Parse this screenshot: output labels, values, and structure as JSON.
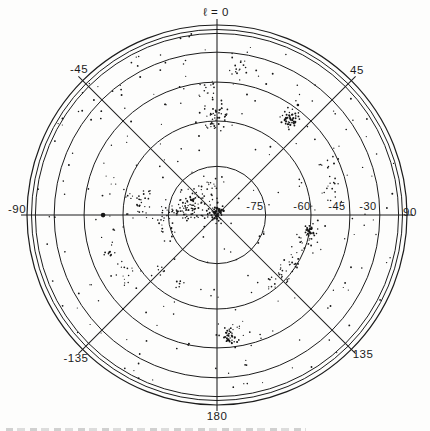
{
  "figure": {
    "background_color": "#fdfdfc",
    "ink_color": "#1c1c1c",
    "dot_color": "#161616",
    "top_label": "ℓ = 0",
    "bottom_label": "180",
    "caption_fragment_present": true
  },
  "chart_data": {
    "type": "scatter",
    "title": "ℓ = 0",
    "xlabel": "galactic longitude ℓ (deg, around rim)",
    "ylabel": "galactic latitude b (deg, radial rings)",
    "legend": [],
    "grid": "polar",
    "projection": {
      "kind": "south-polar-cap",
      "center_px": [
        217,
        215
      ],
      "ring_scale_px": 188,
      "frame_radii_px": [
        190,
        185.5
      ],
      "azimuth_zero": "top",
      "azimuth_direction": "clockwise",
      "latitude_range": [
        -90,
        0
      ]
    },
    "rings_b_deg": [
      -15,
      -30,
      -45,
      -60,
      -75
    ],
    "spokes_l_deg": [
      0,
      45,
      90,
      135,
      180,
      -45,
      -90,
      -135
    ],
    "spoke_overhang_px": 6,
    "angle_labels": [
      {
        "text": "ℓ = 0",
        "x": 216,
        "y": 16
      },
      {
        "text": "45",
        "x": 357,
        "y": 74
      },
      {
        "text": "-45",
        "x": 79,
        "y": 73
      },
      {
        "text": "90",
        "x": 410,
        "y": 216
      },
      {
        "text": "-90",
        "x": 17,
        "y": 213
      },
      {
        "text": "135",
        "x": 363,
        "y": 358
      },
      {
        "text": "-135",
        "x": 76,
        "y": 362
      },
      {
        "text": "180",
        "x": 217,
        "y": 420
      }
    ],
    "ring_labels": [
      {
        "text": "-75",
        "x": 255,
        "y": 210
      },
      {
        "text": "-60",
        "x": 302,
        "y": 210
      },
      {
        "text": "-45",
        "x": 337,
        "y": 210
      },
      {
        "text": "-30",
        "x": 368,
        "y": 210
      }
    ],
    "clusters": [
      {
        "name": "central-core",
        "l": 0,
        "b": -89.3,
        "sigma_deg": 1.0,
        "n": 55,
        "dot": 0.9
      },
      {
        "name": "core-halo",
        "l": -60,
        "b": -87.5,
        "sigma_deg": 2.3,
        "n": 22,
        "dot": 0.8
      },
      {
        "name": "west-complex-main",
        "l": -77,
        "b": -80.5,
        "sigma_deg": 2.2,
        "n": 60,
        "dot": 0.85
      },
      {
        "name": "west-complex-outer",
        "l": -93,
        "b": -74.5,
        "sigma_deg": 2.8,
        "n": 35,
        "dot": 0.8
      },
      {
        "name": "west-complex-upper",
        "l": -53,
        "b": -80.0,
        "sigma_deg": 1.8,
        "n": 25,
        "dot": 0.8
      },
      {
        "name": "above-center-knot",
        "l": -10,
        "b": -80.0,
        "sigma_deg": 1.5,
        "n": 12,
        "dot": 0.8
      },
      {
        "name": "west-ring-clump",
        "l": -79,
        "b": -65.0,
        "sigma_deg": 2.0,
        "n": 28,
        "dot": 0.8
      },
      {
        "name": "north-axis-clump",
        "l": 1,
        "b": -57.5,
        "sigma_deg": 1.8,
        "n": 30,
        "dot": 0.85
      },
      {
        "name": "north-axis-clump-lower",
        "l": -3,
        "b": -61.0,
        "sigma_deg": 1.2,
        "n": 12,
        "dot": 0.8
      },
      {
        "name": "north-small-clump",
        "l": -4.5,
        "b": -48.0,
        "sigma_deg": 1.4,
        "n": 15,
        "dot": 0.8
      },
      {
        "name": "north-loose-clump",
        "l": 7.7,
        "b": -37.5,
        "sigma_deg": 1.8,
        "n": 17,
        "dot": 0.8
      },
      {
        "name": "northeast-dense-cluster",
        "l": 37,
        "b": -50.0,
        "sigma_deg": 1.3,
        "n": 48,
        "dot": 0.9
      },
      {
        "name": "northeast-big-dot",
        "l": 36.4,
        "b": -43.4,
        "sigma_deg": 0.05,
        "n": 1,
        "dot": 1.7
      },
      {
        "name": "east-stream-a",
        "l": 66,
        "b": -49.0,
        "sigma_deg": 1.5,
        "n": 8,
        "dot": 0.75
      },
      {
        "name": "east-stream-b",
        "l": 74,
        "b": -50.5,
        "sigma_deg": 1.5,
        "n": 9,
        "dot": 0.75
      },
      {
        "name": "east-stream-c",
        "l": 81,
        "b": -51.5,
        "sigma_deg": 1.5,
        "n": 8,
        "dot": 0.75
      },
      {
        "name": "southeast-dense-clump",
        "l": 98.5,
        "b": -59.5,
        "sigma_deg": 1.2,
        "n": 28,
        "dot": 0.9
      },
      {
        "name": "southeast-stream-a",
        "l": 108,
        "b": -61.0,
        "sigma_deg": 1.5,
        "n": 14,
        "dot": 0.8
      },
      {
        "name": "southeast-stream-b",
        "l": 120,
        "b": -61.5,
        "sigma_deg": 1.6,
        "n": 16,
        "dot": 0.8
      },
      {
        "name": "southeast-stream-c",
        "l": 131,
        "b": -62.5,
        "sigma_deg": 1.5,
        "n": 14,
        "dot": 0.8
      },
      {
        "name": "southeast-stream-d",
        "l": 140,
        "b": -62.0,
        "sigma_deg": 1.4,
        "n": 12,
        "dot": 0.8
      },
      {
        "name": "south-axis-cluster",
        "l": 174,
        "b": -49.0,
        "sigma_deg": 1.3,
        "n": 32,
        "dot": 0.9
      },
      {
        "name": "south-axis-halo",
        "l": 172,
        "b": -52.5,
        "sigma_deg": 2.2,
        "n": 12,
        "dot": 0.75
      },
      {
        "name": "southwest-knot-1",
        "l": -108.7,
        "b": -52.3,
        "sigma_deg": 0.7,
        "n": 7,
        "dot": 0.9
      },
      {
        "name": "southwest-loose-group",
        "l": -123,
        "b": -54.5,
        "sigma_deg": 2.3,
        "n": 14,
        "dot": 0.75
      },
      {
        "name": "southwest-knot-2",
        "l": -134.5,
        "b": -65.0,
        "sigma_deg": 0.9,
        "n": 6,
        "dot": 0.85
      },
      {
        "name": "southwest-knot-3",
        "l": -152,
        "b": -65.5,
        "sigma_deg": 0.8,
        "n": 6,
        "dot": 0.85
      },
      {
        "name": "west-axis-big-dot",
        "l": -90,
        "b": -52.7,
        "sigma_deg": 0.05,
        "n": 1,
        "dot": 2.2
      }
    ],
    "field": {
      "count": 250,
      "seed": 1234,
      "max_radius_px": 184
    }
  }
}
